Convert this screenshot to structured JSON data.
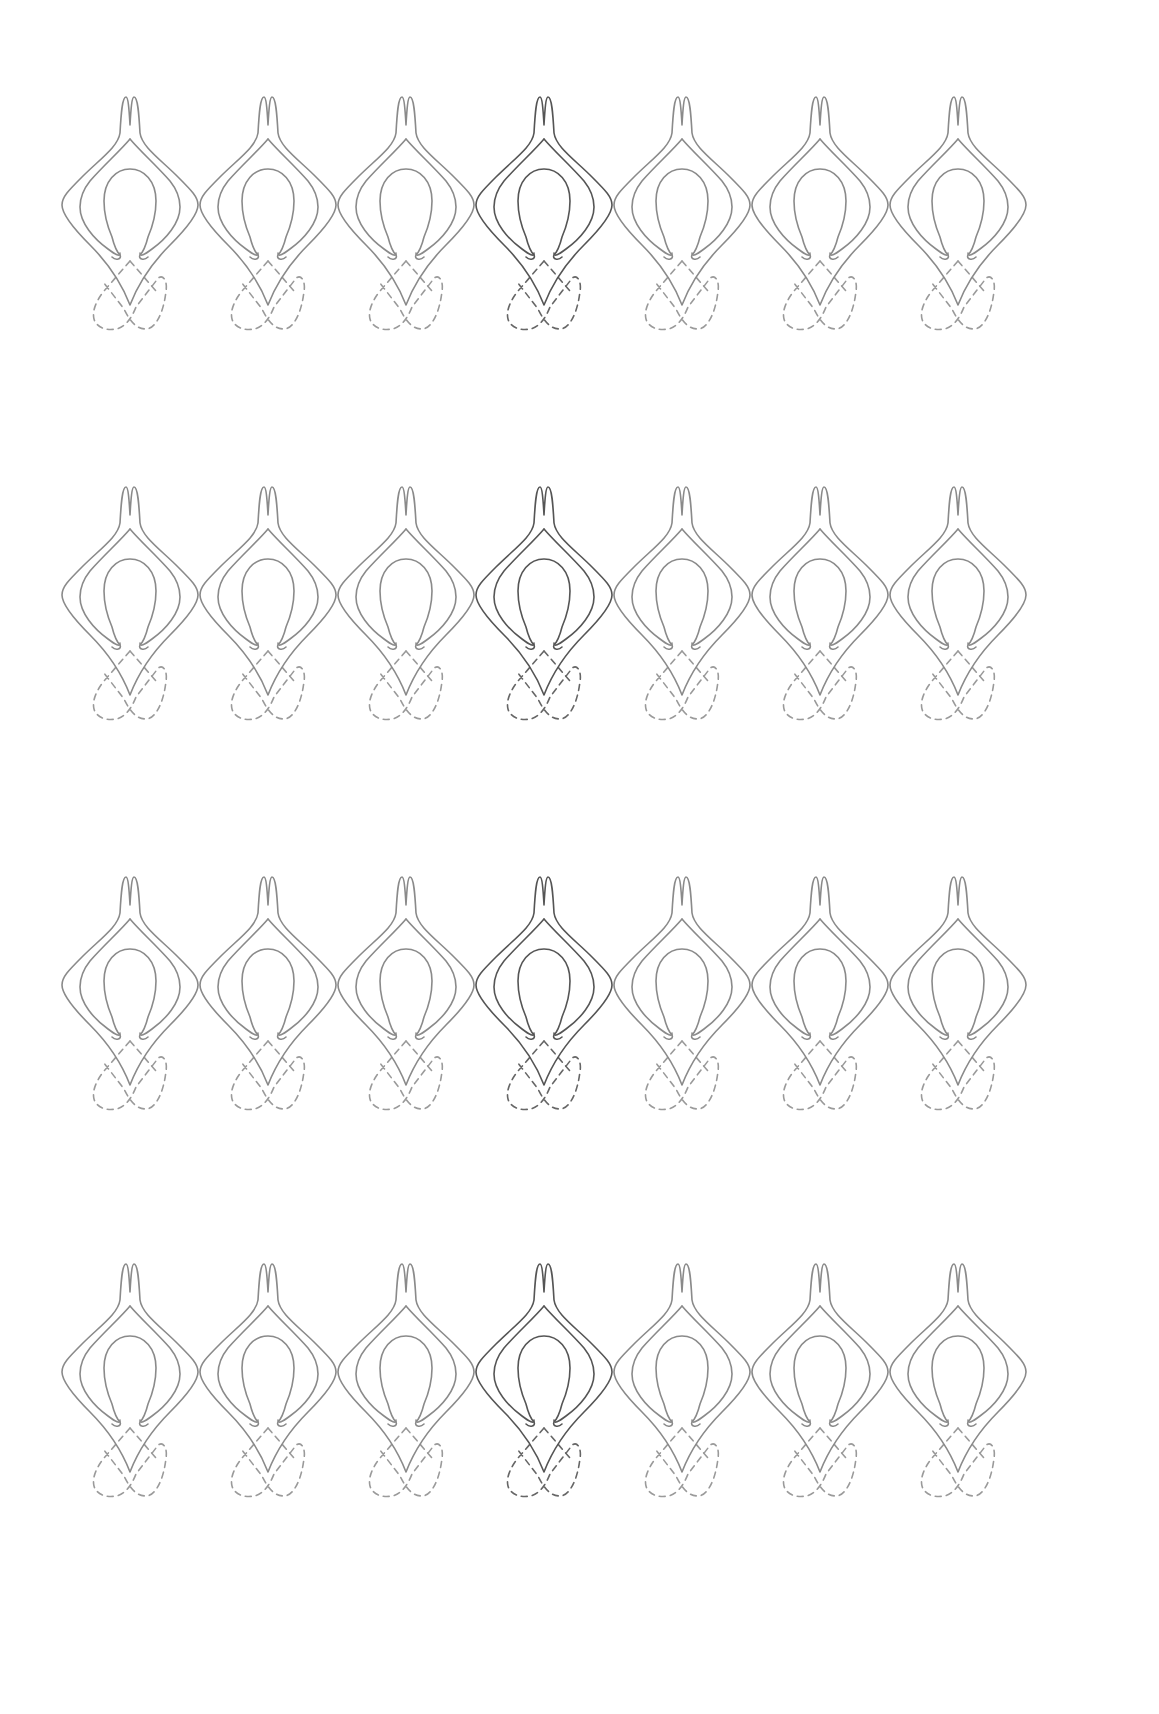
{
  "pattern": {
    "rows": 4,
    "columns": 7,
    "origin_x": 60,
    "row_tops": [
      95,
      485,
      875,
      1262
    ],
    "column_pitch": 138,
    "highlight_column": 3,
    "colors": {
      "background": "#ffffff",
      "stroke": "#8a8a8a",
      "stroke_highlight": "#555555",
      "dash": "#9a9a9a",
      "dash_highlight": "#666666"
    },
    "motif": {
      "name": "ogee-teardrop-with-omega-loop",
      "parts": [
        "outer-ogee-outline",
        "inner-ogee-outline",
        "omega-loop",
        "dashed-crossed-loops"
      ]
    }
  }
}
